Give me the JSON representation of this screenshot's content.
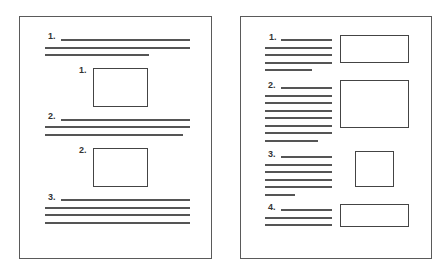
{
  "diagram": {
    "left_page": {
      "layout": "figures-between-text",
      "sections": [
        {
          "label": "1.",
          "line_count": 3
        },
        {
          "label": "2.",
          "line_count": 3
        },
        {
          "label": "3.",
          "line_count": 4
        }
      ],
      "figures": [
        {
          "label": "1."
        },
        {
          "label": "2."
        }
      ]
    },
    "right_page": {
      "layout": "figures-beside-text",
      "sections": [
        {
          "label": "1.",
          "line_count": 5,
          "figure_shape": "wide-rectangle"
        },
        {
          "label": "2.",
          "line_count": 8,
          "figure_shape": "large-rectangle"
        },
        {
          "label": "3.",
          "line_count": 6,
          "figure_shape": "square"
        },
        {
          "label": "4.",
          "line_count": 3,
          "figure_shape": "wide-rectangle"
        }
      ]
    },
    "colors": {
      "line": "#555555",
      "border": "#5a5a5a",
      "background": "#ffffff"
    }
  }
}
